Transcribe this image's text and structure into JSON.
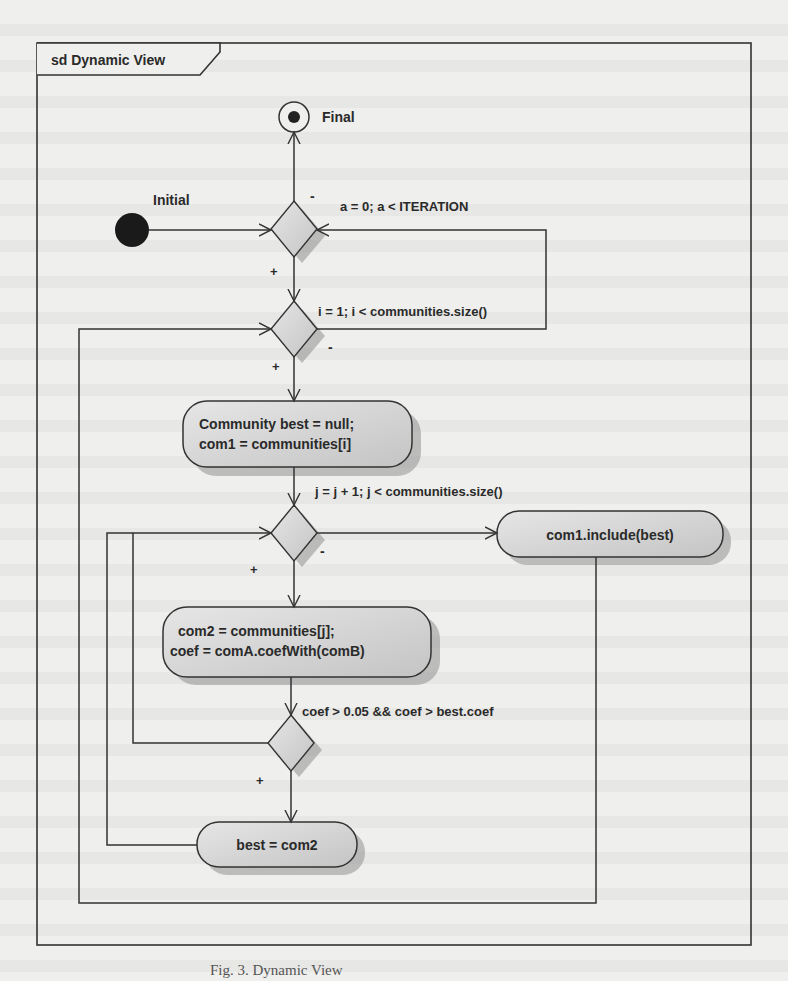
{
  "frame": {
    "title": "sd Dynamic View"
  },
  "nodes": {
    "final": {
      "label": "Final"
    },
    "initial": {
      "label": "Initial"
    },
    "action_init_best": {
      "line1": "Community best = null;",
      "line2": "com1 = communities[i]"
    },
    "action_com2": {
      "line1": "com2 = communities[j];",
      "line2": "coef = comA.coefWith(comB)"
    },
    "action_include": {
      "label": "com1.include(best)"
    },
    "action_best": {
      "label": "best = com2"
    }
  },
  "guards": {
    "outer_loop": "a = 0; a < ITERATION",
    "i_loop": "i = 1; i < communities.size()",
    "j_loop": "j = j + 1; j < communities.size()",
    "coef_check": "coef > 0.05 && coef > best.coef"
  },
  "markers": {
    "plus": "+",
    "minus": "-"
  },
  "caption": "Fig. 3. Dynamic View",
  "colors": {
    "node_fill": "#d4d4d4",
    "node_shadow": "#9a9a9a",
    "stroke": "#333333",
    "background": "#efefed"
  }
}
